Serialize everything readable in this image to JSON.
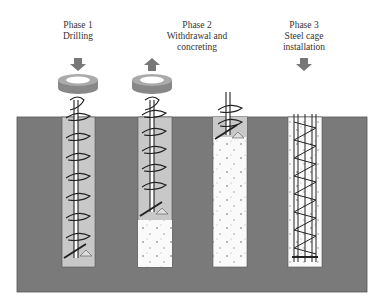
{
  "phases": [
    {
      "title": "Phase 1",
      "subtitle": "Drilling",
      "subtitle2": ""
    },
    {
      "title": "Phase 2",
      "subtitle": "Withdrawal and",
      "subtitle2": "concreting"
    },
    {
      "title": "Phase 3",
      "subtitle": "Steel cage",
      "subtitle2": "installation"
    }
  ],
  "colors": {
    "ground": "#7a7a7a",
    "auger_hole": "#c8c8c8",
    "concrete": "#fafafa",
    "arrow": "#777777"
  },
  "icons": [
    "down-arrow-icon",
    "rotation-icon",
    "up-arrow-icon",
    "auger-icon",
    "steel-cage-icon"
  ]
}
